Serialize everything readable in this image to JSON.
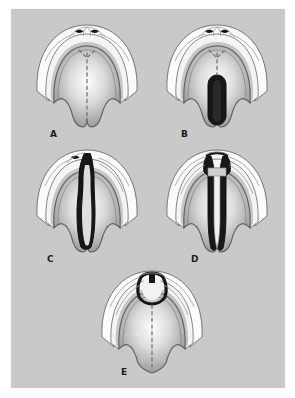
{
  "figure": {
    "background_color": "#c9c9c9",
    "page_color": "#ffffff",
    "palette": {
      "lip_white": "#fbfbfb",
      "palate_light": "#f2f2f2",
      "palate_mid": "#b9b9b9",
      "palate_dark": "#8f8f8f",
      "outline": "#5a5a5a",
      "cleft_dark": "#1a1a1a",
      "raphe_dash": "#6e6e6e",
      "label_color": "#1c1c1c"
    },
    "panels": [
      {
        "id": "a",
        "label": "A",
        "label_x": 39,
        "label_y": 121,
        "x": 14,
        "y": 8,
        "width": 124,
        "height": 112,
        "caption": "Bifid uvula with intact palate",
        "features": {
          "nostrils": 2,
          "cleft": "none",
          "uvula": "bifid",
          "midline_raphe": "dashed",
          "alveolus": "intact",
          "lip": "intact"
        }
      },
      {
        "id": "b",
        "label": "B",
        "label_x": 170,
        "label_y": 121,
        "x": 144,
        "y": 8,
        "width": 124,
        "height": 112,
        "caption": "Cleft of the soft palate",
        "features": {
          "nostrils": 2,
          "cleft": "soft-palate",
          "uvula": "bifid",
          "midline_raphe": "dashed",
          "alveolus": "intact",
          "lip": "intact"
        }
      },
      {
        "id": "c",
        "label": "C",
        "label_x": 36,
        "label_y": 246,
        "x": 14,
        "y": 133,
        "width": 124,
        "height": 112,
        "caption": "Unilateral complete cleft lip and palate",
        "features": {
          "nostrils": 1,
          "cleft": "unilateral-complete",
          "uvula": "bifid",
          "midline_raphe": "absent",
          "alveolus": "clefted-unilateral",
          "lip": "clefted"
        }
      },
      {
        "id": "d",
        "label": "D",
        "label_x": 180,
        "label_y": 246,
        "x": 144,
        "y": 133,
        "width": 124,
        "height": 112,
        "caption": "Bilateral complete cleft lip and palate",
        "features": {
          "nostrils": 0,
          "cleft": "bilateral-complete",
          "uvula": "bifid",
          "midline_raphe": "absent",
          "alveolus": "clefted-bilateral",
          "lip": "clefted-bilateral"
        }
      },
      {
        "id": "e",
        "label": "E",
        "label_x": 110,
        "label_y": 359,
        "x": 79,
        "y": 254,
        "width": 124,
        "height": 112,
        "caption": "Isolated alveolar cleft with intact palate",
        "features": {
          "nostrils": 0,
          "cleft": "alveolar-only",
          "uvula": "intact",
          "midline_raphe": "dashed",
          "alveolus": "clefted-anterior",
          "lip": "intact"
        }
      }
    ]
  }
}
